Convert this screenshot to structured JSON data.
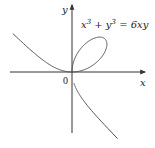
{
  "figure": {
    "equation": {
      "base1": "x",
      "exp1": "3",
      "op": " + ",
      "base2": "y",
      "exp2": "3",
      "rhs": " = 6xy"
    },
    "axes": {
      "x_label": "x",
      "y_label": "y",
      "origin_label": "0"
    },
    "colors": {
      "axis": "#333333",
      "curve": "#555555",
      "text": "#222222"
    }
  },
  "chart_data": {
    "type": "line",
    "curve_name": "Folium of Descartes",
    "xlabel": "x",
    "ylabel": "y",
    "origin_label": "0",
    "parametrization": {
      "x": "6t/(1+t^3)",
      "y": "6t^2/(1+t^3)"
    },
    "notable_points": [
      {
        "x": 0,
        "y": 0,
        "label": "origin"
      },
      {
        "x": 3,
        "y": 3,
        "label": "loop tip"
      }
    ],
    "xlim": [
      -5.6,
      6.6
    ],
    "ylim": [
      -6.2,
      6.1
    ],
    "grid": false,
    "legend": "none"
  }
}
